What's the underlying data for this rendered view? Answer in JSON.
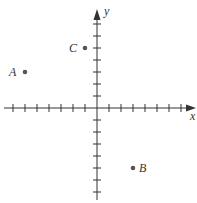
{
  "chart_data": {
    "type": "scatter",
    "title": "",
    "xlabel": "x",
    "ylabel": "y",
    "xlim": [
      -7,
      8
    ],
    "ylim": [
      -7,
      8
    ],
    "grid": false,
    "x_ticks": [
      -7,
      -6,
      -5,
      -4,
      -3,
      -2,
      -1,
      1,
      2,
      3,
      4,
      5,
      6,
      7
    ],
    "y_ticks": [
      -7,
      -6,
      -5,
      -4,
      -3,
      -2,
      -1,
      1,
      2,
      3,
      4,
      5,
      6,
      7
    ],
    "points": [
      {
        "label": "A",
        "x": -6,
        "y": 3
      },
      {
        "label": "B",
        "x": 3,
        "y": -5
      },
      {
        "label": "C",
        "x": -1,
        "y": 5
      }
    ]
  },
  "style": {
    "axis_color": "#333333",
    "point_color": "#555555"
  }
}
